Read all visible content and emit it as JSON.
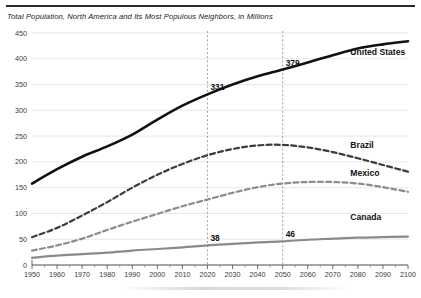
{
  "document": {
    "top_rule": true
  },
  "chart_data": {
    "type": "line",
    "title": "Total Population, North America and Its Most Populous Neighbors, in Millions",
    "xlabel": "",
    "ylabel": "",
    "xlim": [
      1950,
      2100
    ],
    "ylim": [
      0,
      450
    ],
    "ytick_step": 50,
    "xtick_step": 10,
    "grid": "horizontal",
    "legend": "inline-right-labels",
    "ytick_labels": [
      "0",
      "50",
      "100",
      "150",
      "200",
      "250",
      "300",
      "350",
      "400",
      "450"
    ],
    "xtick_labels": [
      "1950",
      "1960",
      "1970",
      "1980",
      "1990",
      "2000",
      "2010",
      "2020",
      "2030",
      "2040",
      "2050",
      "2060",
      "2070",
      "2080",
      "2090",
      "2100"
    ],
    "x": [
      1950,
      1960,
      1970,
      1980,
      1990,
      2000,
      2010,
      2020,
      2030,
      2040,
      2050,
      2060,
      2070,
      2080,
      2090,
      2100
    ],
    "series": [
      {
        "name": "United States",
        "style": "solid",
        "color": "#111111",
        "width": 2.6,
        "values": [
          158,
          186,
          210,
          230,
          253,
          282,
          309,
          331,
          350,
          366,
          379,
          393,
          407,
          420,
          428,
          434
        ]
      },
      {
        "name": "Brazil",
        "style": "dashed",
        "color": "#3c3c3c",
        "width": 2.2,
        "values": [
          54,
          72,
          96,
          122,
          150,
          175,
          196,
          213,
          225,
          232,
          233,
          228,
          219,
          207,
          194,
          181
        ]
      },
      {
        "name": "Mexico",
        "style": "dashed",
        "color": "#8c8c8c",
        "width": 2.2,
        "values": [
          28,
          38,
          51,
          68,
          84,
          99,
          114,
          127,
          140,
          151,
          158,
          161,
          161,
          158,
          151,
          142
        ]
      },
      {
        "name": "Canada",
        "style": "solid",
        "color": "#8a8a8a",
        "width": 2.2,
        "values": [
          14,
          18,
          21,
          24,
          28,
          31,
          34,
          38,
          41,
          44,
          46,
          49,
          51,
          53,
          54,
          55
        ]
      }
    ],
    "reference_lines": [
      {
        "x": 2020,
        "style": "dashed"
      },
      {
        "x": 2050,
        "style": "dashed"
      }
    ],
    "annotations": [
      {
        "label": "331",
        "x": 2020,
        "y": 331,
        "series": "United States"
      },
      {
        "label": "379",
        "x": 2050,
        "y": 379,
        "series": "United States"
      },
      {
        "label": "38",
        "x": 2020,
        "y": 38,
        "series": "Canada"
      },
      {
        "label": "46",
        "x": 2050,
        "y": 46,
        "series": "Canada"
      }
    ],
    "series_labels": [
      {
        "text": "United States",
        "x": 2077,
        "y": 408
      },
      {
        "text": "Brazil",
        "x": 2077,
        "y": 226
      },
      {
        "text": "Mexico",
        "x": 2077,
        "y": 173
      },
      {
        "text": "Canada",
        "x": 2077,
        "y": 88
      }
    ]
  }
}
